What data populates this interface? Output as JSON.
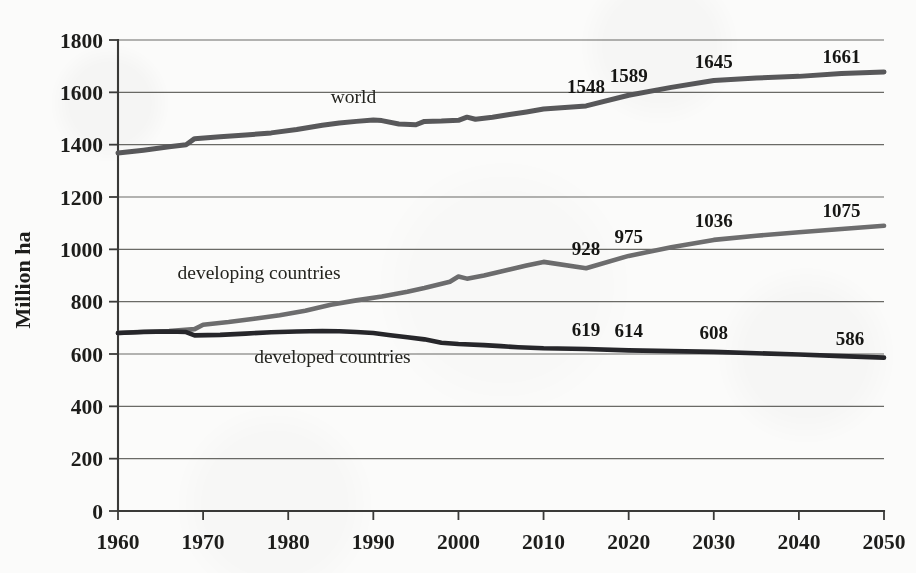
{
  "chart_data": {
    "type": "line",
    "title": "",
    "xlabel": "",
    "ylabel": "Million ha",
    "xlim": [
      1960,
      2050
    ],
    "ylim": [
      0,
      1800
    ],
    "grid": true,
    "legend": "inline-labels",
    "x_ticks": [
      "1960",
      "1970",
      "1980",
      "1990",
      "2000",
      "2010",
      "2020",
      "2030",
      "2040",
      "2050"
    ],
    "y_ticks": [
      "0",
      "200",
      "400",
      "600",
      "800",
      "1000",
      "1200",
      "1400",
      "1600",
      "1800"
    ],
    "series": [
      {
        "name": "world",
        "label": "world",
        "color": "#58585a",
        "x": [
          1960,
          1963,
          1966,
          1968,
          1969,
          1972,
          1975,
          1978,
          1981,
          1984,
          1986,
          1988,
          1990,
          1991,
          1993,
          1995,
          1996,
          1998,
          2000,
          2001,
          2002,
          2004,
          2006,
          2008,
          2010,
          2015,
          2020,
          2025,
          2030,
          2035,
          2040,
          2045,
          2050
        ],
        "values": [
          1368,
          1379,
          1392,
          1400,
          1423,
          1430,
          1437,
          1445,
          1458,
          1474,
          1483,
          1489,
          1494,
          1492,
          1479,
          1476,
          1489,
          1490,
          1493,
          1505,
          1497,
          1505,
          1515,
          1525,
          1536,
          1548,
          1589,
          1619,
          1645,
          1655,
          1661,
          1672,
          1678
        ],
        "point_labels": [
          {
            "x": 2015,
            "value": 1548
          },
          {
            "x": 2020,
            "value": 1589
          },
          {
            "x": 2030,
            "value": 1645
          },
          {
            "x": 2045,
            "value": 1661
          }
        ]
      },
      {
        "name": "developing countries",
        "label": "developing countries",
        "color": "#6d6d6e",
        "x": [
          1960,
          1963,
          1966,
          1969,
          1970,
          1973,
          1976,
          1979,
          1982,
          1985,
          1988,
          1991,
          1994,
          1996,
          1999,
          2000,
          2001,
          2003,
          2005,
          2008,
          2010,
          2015,
          2020,
          2025,
          2030,
          2035,
          2040,
          2045,
          2050
        ],
        "values": [
          680,
          685,
          688,
          695,
          712,
          722,
          735,
          748,
          765,
          788,
          805,
          820,
          838,
          852,
          876,
          896,
          888,
          900,
          915,
          938,
          952,
          928,
          975,
          1008,
          1036,
          1052,
          1065,
          1078,
          1090
        ],
        "point_labels": [
          {
            "x": 2015,
            "value": 928
          },
          {
            "x": 2020,
            "value": 975
          },
          {
            "x": 2030,
            "value": 1036
          },
          {
            "x": 2045,
            "value": 1075
          }
        ]
      },
      {
        "name": "developed countries",
        "label": "developed countries",
        "color": "#26262a",
        "x": [
          1960,
          1963,
          1966,
          1968,
          1969,
          1972,
          1975,
          1978,
          1981,
          1984,
          1986,
          1988,
          1990,
          1992,
          1994,
          1996,
          1998,
          2000,
          2003,
          2005,
          2007,
          2010,
          2015,
          2020,
          2025,
          2030,
          2035,
          2040,
          2045,
          2050
        ],
        "values": [
          680,
          684,
          686,
          684,
          671,
          673,
          678,
          683,
          686,
          688,
          687,
          684,
          680,
          672,
          664,
          656,
          643,
          638,
          634,
          630,
          626,
          622,
          619,
          614,
          611,
          608,
          603,
          598,
          592,
          586
        ],
        "point_labels": [
          {
            "x": 2015,
            "value": 619
          },
          {
            "x": 2020,
            "value": 614
          },
          {
            "x": 2030,
            "value": 608
          },
          {
            "x": 2046,
            "value": 586
          }
        ]
      }
    ],
    "series_inline_labels": [
      {
        "name": "world",
        "text": "world",
        "x": 1985,
        "y": 1560
      },
      {
        "name": "developing countries",
        "text": "developing countries",
        "x": 1967,
        "y": 885
      },
      {
        "name": "developed countries",
        "text": "developed countries",
        "x": 1976,
        "y": 565
      }
    ]
  }
}
